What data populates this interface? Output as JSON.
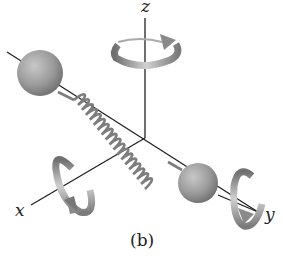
{
  "diagram": {
    "axes": {
      "x": {
        "label": "x"
      },
      "y": {
        "label": "y"
      },
      "z": {
        "label": "z"
      }
    },
    "caption": "(b)",
    "colors": {
      "axis": "#222222",
      "sphere": "#9a9a9a",
      "spring": "#8a8a8a",
      "arrow": "#9c9c9c"
    }
  }
}
